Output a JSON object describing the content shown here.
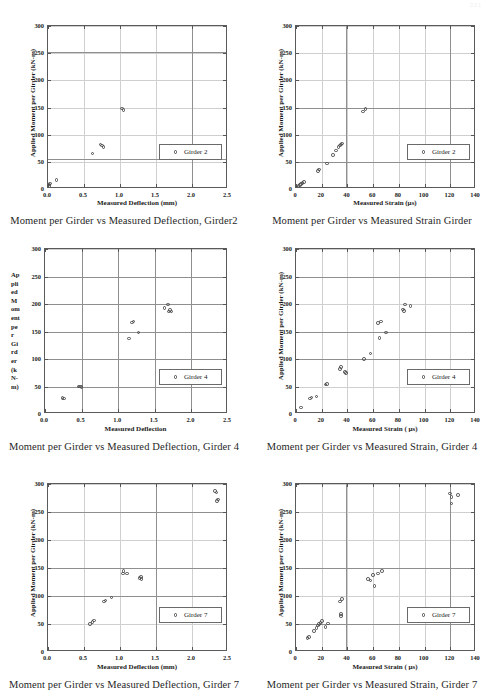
{
  "page": {
    "header_artifact": "221"
  },
  "figures": [
    {
      "caption": "Moment per Girder vs Measured Deflection, Girder2",
      "legend_label": "Girder 2",
      "ylabel_mode": "rotated",
      "chart_data": {
        "type": "scatter",
        "title": "Moment per Girder vs Measured Deflection, Girder2",
        "xlabel": "Measured Deflection (mm)",
        "ylabel": "Applied Moment per Girder (kN-m)",
        "xlim": [
          0.0,
          2.5
        ],
        "ylim": [
          0,
          300
        ],
        "xticks": [
          0.0,
          0.5,
          1.0,
          1.5,
          2.0,
          2.5
        ],
        "xtick_labels": [
          "0.0",
          "0.5",
          "1.0",
          "1.5",
          "2.0",
          "2.5"
        ],
        "yticks": [
          0,
          50,
          100,
          150,
          200,
          250,
          300
        ],
        "ytick_labels": [
          "0",
          "50",
          "100",
          "150",
          "200",
          "250",
          "300"
        ],
        "grid": true,
        "gridlines_h": [
          55,
          253
        ],
        "gridlines_v": [
          2.0
        ],
        "legend": "Girder 2",
        "legend_position": "lower-right",
        "series": [
          {
            "name": "Girder 2",
            "points": [
              [
                0.01,
                5
              ],
              [
                0.02,
                8
              ],
              [
                0.03,
                10
              ],
              [
                0.12,
                17
              ],
              [
                0.62,
                65
              ],
              [
                0.73,
                82
              ],
              [
                0.75,
                80
              ],
              [
                0.77,
                77
              ],
              [
                1.03,
                148
              ],
              [
                1.05,
                145
              ]
            ]
          }
        ]
      }
    },
    {
      "caption": "Moment per Girder vs Measured Strain Girder",
      "legend_label": "Girder 2",
      "ylabel_mode": "rotated",
      "chart_data": {
        "type": "scatter",
        "title": "Moment per Girder vs Measured Strain Girder",
        "xlabel": "Measured Strain   (µs)",
        "ylabel": "Applied Moment per Girder (kN-m)",
        "xlim": [
          0,
          140
        ],
        "ylim": [
          0,
          300
        ],
        "xticks": [
          0,
          20,
          40,
          60,
          80,
          100,
          120,
          140
        ],
        "xtick_labels": [
          "0",
          "20",
          "40",
          "60",
          "80",
          "100",
          "120",
          "140"
        ],
        "yticks": [
          0,
          50,
          100,
          150,
          200,
          250,
          300
        ],
        "ytick_labels": [
          "0",
          "50",
          "100",
          "150",
          "200",
          "250",
          "300"
        ],
        "grid": true,
        "gridlines_h": [
          50,
          150
        ],
        "gridlines_v": [
          39,
          120
        ],
        "legend": "Girder 2",
        "legend_position": "lower-right",
        "series": [
          {
            "name": "Girder 2",
            "points": [
              [
                1,
                3
              ],
              [
                2,
                5
              ],
              [
                3,
                7
              ],
              [
                4,
                9
              ],
              [
                5,
                11
              ],
              [
                6,
                13
              ],
              [
                17,
                33
              ],
              [
                18,
                36
              ],
              [
                24,
                47
              ],
              [
                29,
                63
              ],
              [
                31,
                71
              ],
              [
                33,
                77
              ],
              [
                34,
                80
              ],
              [
                35,
                82
              ],
              [
                36,
                84
              ],
              [
                52,
                143
              ],
              [
                54,
                147
              ]
            ]
          }
        ]
      }
    },
    {
      "caption": "Moment per Girder vs Measured Deflection, Girder 4",
      "legend_label": "Girder 4",
      "ylabel_mode": "stacked",
      "ylabel_stacked": [
        "Ap",
        "pli",
        "ed",
        "M",
        "om",
        "ent",
        "pe",
        "r",
        "Gi",
        "rd",
        "er",
        "(k",
        "N-",
        "m)"
      ],
      "chart_data": {
        "type": "scatter",
        "title": "Moment per Girder vs Measured Deflection, Girder 4",
        "xlabel": "Measured Deflection",
        "ylabel": "Applied Moment per Girder (kN-m)",
        "xlim": [
          0.0,
          2.5
        ],
        "ylim": [
          0,
          300
        ],
        "xticks": [
          0.0,
          0.5,
          1.0,
          1.5,
          2.0,
          2.5
        ],
        "xtick_labels": [
          "0.0",
          "0.5",
          "1.0",
          "1.5",
          "2.0",
          "2.5"
        ],
        "yticks": [
          0,
          50,
          100,
          150,
          200,
          250,
          300
        ],
        "ytick_labels": [
          "0",
          "50",
          "100",
          "150",
          "200",
          "250",
          "300"
        ],
        "grid": true,
        "gridlines_h": [
          50,
          100,
          150,
          200,
          250
        ],
        "gridlines_v": [
          0.5,
          1.0,
          1.5,
          2.0
        ],
        "legend": "Girder 4",
        "legend_position": "lower-right",
        "series": [
          {
            "name": "Girder 4",
            "points": [
              [
                0.24,
                29
              ],
              [
                0.26,
                28
              ],
              [
                0.46,
                50
              ],
              [
                0.48,
                50
              ],
              [
                0.5,
                49
              ],
              [
                1.15,
                137
              ],
              [
                1.19,
                166
              ],
              [
                1.21,
                168
              ],
              [
                1.28,
                148
              ],
              [
                1.63,
                193
              ],
              [
                1.68,
                199
              ],
              [
                1.69,
                186
              ],
              [
                1.71,
                189
              ],
              [
                1.73,
                186
              ]
            ]
          }
        ]
      }
    },
    {
      "caption": "Moment per Girder vs Measured Strain, Girder 4",
      "legend_label": "Girder 4",
      "ylabel_mode": "rotated",
      "chart_data": {
        "type": "scatter",
        "title": "Moment per Girder vs Measured Strain, Girder 4",
        "xlabel": "Measured Strain (  µs)",
        "ylabel": "Applied Moment per Girder (kN-m)",
        "xlim": [
          0,
          140
        ],
        "ylim": [
          0,
          300
        ],
        "xticks": [
          0,
          20,
          40,
          60,
          80,
          100,
          120,
          140
        ],
        "xtick_labels": [
          "0",
          "20",
          "40",
          "60",
          "80",
          "100",
          "120",
          "140"
        ],
        "yticks": [
          0,
          50,
          100,
          150,
          200,
          250,
          300
        ],
        "ytick_labels": [
          "0",
          "50",
          "100",
          "150",
          "200",
          "250",
          "300"
        ],
        "grid": true,
        "gridlines_h": [
          100,
          150,
          250
        ],
        "gridlines_v": [],
        "legend": "Girder 4",
        "legend_position": "lower-right",
        "series": [
          {
            "name": "Girder 4",
            "points": [
              [
                4,
                12
              ],
              [
                11,
                28
              ],
              [
                12,
                30
              ],
              [
                16,
                32
              ],
              [
                23,
                54
              ],
              [
                24,
                55
              ],
              [
                34,
                82
              ],
              [
                35,
                85
              ],
              [
                38,
                76
              ],
              [
                39,
                75
              ],
              [
                53,
                100
              ],
              [
                58,
                110
              ],
              [
                64,
                165
              ],
              [
                66,
                168
              ],
              [
                65,
                138
              ],
              [
                70,
                148
              ],
              [
                83,
                190
              ],
              [
                84,
                187
              ],
              [
                85,
                199
              ],
              [
                89,
                196
              ]
            ]
          }
        ]
      }
    },
    {
      "caption": "Moment per Girder vs Measured Deflection, Girder 7",
      "legend_label": "Girder 7",
      "ylabel_mode": "rotated",
      "chart_data": {
        "type": "scatter",
        "title": "Moment per Girder vs Measured Deflection, Girder 7",
        "xlabel": "Measured Deflection (mm)",
        "ylabel": "Applied Moment per Girder (kN-m)",
        "xlim": [
          0.0,
          2.5
        ],
        "ylim": [
          0,
          300
        ],
        "xticks": [
          0.0,
          0.5,
          1.0,
          1.5,
          2.0,
          2.5
        ],
        "xtick_labels": [
          "0.0",
          "0.5",
          "1.0",
          "1.5",
          "2.0",
          "2.5"
        ],
        "yticks": [
          0,
          50,
          100,
          150,
          200,
          250,
          300
        ],
        "ytick_labels": [
          "0",
          "50",
          "100",
          "150",
          "200",
          "250",
          "300"
        ],
        "grid": true,
        "gridlines_h": [
          100,
          150,
          250
        ],
        "gridlines_v": [
          1.5
        ],
        "legend": "Girder 7",
        "legend_position": "lower-right",
        "series": [
          {
            "name": "Girder 7",
            "points": [
              [
                0.58,
                50
              ],
              [
                0.62,
                54
              ],
              [
                0.64,
                56
              ],
              [
                0.78,
                90
              ],
              [
                0.8,
                92
              ],
              [
                0.88,
                97
              ],
              [
                1.04,
                140
              ],
              [
                1.05,
                145
              ],
              [
                1.1,
                140
              ],
              [
                1.27,
                132
              ],
              [
                1.29,
                134
              ],
              [
                1.3,
                130
              ],
              [
                2.32,
                288
              ],
              [
                2.34,
                285
              ],
              [
                2.35,
                270
              ],
              [
                2.36,
                272
              ]
            ]
          }
        ]
      }
    },
    {
      "caption": "Moment per Girder vs Measured Strain, Girder 7",
      "legend_label": "Girder 7",
      "ylabel_mode": "rotated",
      "chart_data": {
        "type": "scatter",
        "title": "Moment per Girder vs Measured Strain, Girder 7",
        "xlabel": "Measured Strain (  µs)",
        "ylabel": "Applied Moment per Girder (kN-m)",
        "xlim": [
          0,
          140
        ],
        "ylim": [
          0,
          300
        ],
        "xticks": [
          0,
          20,
          40,
          60,
          80,
          100,
          120,
          140
        ],
        "xtick_labels": [
          "0",
          "20",
          "40",
          "60",
          "80",
          "100",
          "120",
          "140"
        ],
        "yticks": [
          0,
          50,
          100,
          150,
          200,
          250,
          300
        ],
        "ytick_labels": [
          "0",
          "50",
          "100",
          "150",
          "200",
          "250",
          "300"
        ],
        "grid": true,
        "gridlines_h": [
          50,
          150
        ],
        "gridlines_v": [
          39,
          120
        ],
        "legend": "Girder 7",
        "legend_position": "lower-right",
        "series": [
          {
            "name": "Girder 7",
            "points": [
              [
                9,
                25
              ],
              [
                10,
                27
              ],
              [
                14,
                37
              ],
              [
                16,
                43
              ],
              [
                17,
                47
              ],
              [
                18,
                50
              ],
              [
                19,
                52
              ],
              [
                20,
                55
              ],
              [
                23,
                45
              ],
              [
                25,
                51
              ],
              [
                34,
                90
              ],
              [
                35,
                68
              ],
              [
                35,
                64
              ],
              [
                36,
                95
              ],
              [
                56,
                130
              ],
              [
                58,
                128
              ],
              [
                60,
                137
              ],
              [
                61,
                118
              ],
              [
                64,
                140
              ],
              [
                67,
                145
              ],
              [
                120,
                283
              ],
              [
                121,
                277
              ],
              [
                121,
                265
              ],
              [
                126,
                280
              ]
            ]
          }
        ]
      }
    }
  ]
}
